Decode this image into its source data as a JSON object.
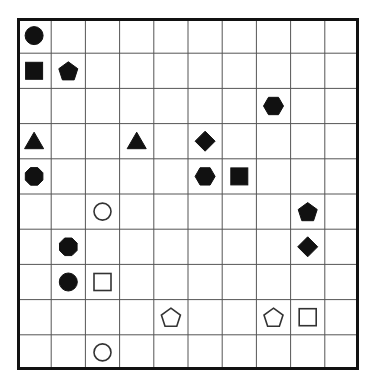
{
  "puzzle": {
    "rows": 10,
    "cols": 10,
    "colors": {
      "background": "#ffffff",
      "grid_line": "#555555",
      "border": "#111111",
      "filled": "#111111",
      "outline": "#333333"
    },
    "pieces": [
      {
        "row": 0,
        "col": 0,
        "shape": "circle",
        "fill": "filled"
      },
      {
        "row": 1,
        "col": 0,
        "shape": "square",
        "fill": "filled"
      },
      {
        "row": 1,
        "col": 1,
        "shape": "pentagon",
        "fill": "filled"
      },
      {
        "row": 2,
        "col": 7,
        "shape": "hexagon",
        "fill": "filled"
      },
      {
        "row": 3,
        "col": 0,
        "shape": "triangle",
        "fill": "filled"
      },
      {
        "row": 3,
        "col": 3,
        "shape": "triangle",
        "fill": "filled"
      },
      {
        "row": 3,
        "col": 5,
        "shape": "diamond",
        "fill": "filled"
      },
      {
        "row": 4,
        "col": 0,
        "shape": "octagon",
        "fill": "filled"
      },
      {
        "row": 4,
        "col": 5,
        "shape": "hexagon",
        "fill": "filled"
      },
      {
        "row": 4,
        "col": 6,
        "shape": "square",
        "fill": "filled"
      },
      {
        "row": 5,
        "col": 2,
        "shape": "circle",
        "fill": "hollow"
      },
      {
        "row": 5,
        "col": 8,
        "shape": "pentagon",
        "fill": "filled"
      },
      {
        "row": 6,
        "col": 1,
        "shape": "octagon",
        "fill": "filled"
      },
      {
        "row": 6,
        "col": 8,
        "shape": "diamond",
        "fill": "filled"
      },
      {
        "row": 7,
        "col": 1,
        "shape": "circle",
        "fill": "filled"
      },
      {
        "row": 7,
        "col": 2,
        "shape": "square",
        "fill": "hollow"
      },
      {
        "row": 8,
        "col": 4,
        "shape": "pentagon",
        "fill": "hollow"
      },
      {
        "row": 8,
        "col": 7,
        "shape": "pentagon",
        "fill": "hollow"
      },
      {
        "row": 8,
        "col": 8,
        "shape": "square",
        "fill": "hollow"
      },
      {
        "row": 9,
        "col": 2,
        "shape": "circle",
        "fill": "hollow"
      }
    ]
  }
}
